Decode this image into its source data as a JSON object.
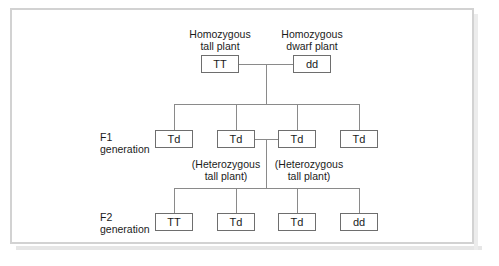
{
  "diagram": {
    "frame_color": "#d2d2d2",
    "line_color": "#8a8a8a",
    "box_border_color": "#6e6e6e",
    "text_color": "#1b1b1b",
    "parents": {
      "left": {
        "caption_line1": "Homozygous",
        "caption_line2": "tall plant",
        "genotype": "TT"
      },
      "right": {
        "caption_line1": "Homozygous",
        "caption_line2": "dwarf plant",
        "genotype": "dd"
      }
    },
    "f1": {
      "row_label_line1": "F1",
      "row_label_line2": "generation",
      "boxes": [
        {
          "genotype": "Td"
        },
        {
          "genotype": "Td"
        },
        {
          "genotype": "Td"
        },
        {
          "genotype": "Td"
        }
      ],
      "annotations": [
        {
          "line1": "(Heterozygous",
          "line2": "tall plant)"
        },
        {
          "line1": "(Heterozygous",
          "line2": "tall plant)"
        }
      ]
    },
    "f2": {
      "row_label_line1": "F2",
      "row_label_line2": "generation",
      "boxes": [
        {
          "genotype": "TT"
        },
        {
          "genotype": "Td"
        },
        {
          "genotype": "Td"
        },
        {
          "genotype": "dd"
        }
      ]
    }
  }
}
